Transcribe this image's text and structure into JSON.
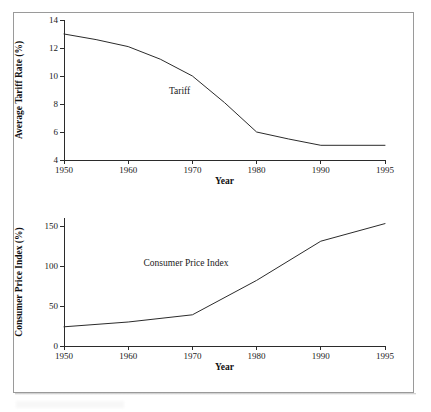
{
  "figure": {
    "background_color": "#ffffff",
    "frame_color": "#9a9a9a",
    "line_color": "#2b2b2b"
  },
  "chart_data": [
    {
      "id": "tariff",
      "type": "line",
      "title": "",
      "xlabel": "Year",
      "ylabel": "Average Tariff Rate (%)",
      "xlim": [
        1950,
        1995
      ],
      "ylim": [
        4,
        14
      ],
      "xticks": [
        1950,
        1960,
        1970,
        1980,
        1990,
        1995
      ],
      "xticklabels": [
        "1950",
        "1960",
        "1970",
        "1980",
        "1990",
        "1995"
      ],
      "yticks": [
        4,
        6,
        8,
        10,
        12,
        14
      ],
      "yticklabels": [
        "4",
        "6",
        "8",
        "10",
        "12",
        "14"
      ],
      "grid": false,
      "legend": "inline-annotation",
      "annotations": [
        {
          "text": "Tariff",
          "x": 1968,
          "y": 8.7
        }
      ],
      "series": [
        {
          "name": "Tariff",
          "x": [
            1950,
            1955,
            1960,
            1965,
            1970,
            1975,
            1980,
            1985,
            1990,
            1995
          ],
          "values": [
            13.0,
            12.6,
            12.1,
            11.2,
            10.0,
            8.1,
            6.0,
            5.5,
            5.05,
            5.05
          ]
        }
      ]
    },
    {
      "id": "cpi",
      "type": "line",
      "title": "",
      "xlabel": "Year",
      "ylabel": "Consumer Price Index (%)",
      "xlim": [
        1950,
        1995
      ],
      "ylim": [
        0,
        160
      ],
      "xticks": [
        1950,
        1960,
        1970,
        1980,
        1990,
        1995
      ],
      "xticklabels": [
        "1950",
        "1960",
        "1970",
        "1980",
        "1990",
        "1995"
      ],
      "yticks": [
        0,
        50,
        100,
        150
      ],
      "yticklabels": [
        "0",
        "50",
        "100",
        "150"
      ],
      "grid": false,
      "legend": "inline-annotation",
      "annotations": [
        {
          "text": "Consumer Price Index",
          "x": 1969,
          "y": 100
        }
      ],
      "series": [
        {
          "name": "Consumer Price Index",
          "x": [
            1950,
            1960,
            1970,
            1980,
            1990,
            1995
          ],
          "values": [
            24,
            30,
            39,
            82,
            131,
            153
          ]
        }
      ]
    }
  ]
}
